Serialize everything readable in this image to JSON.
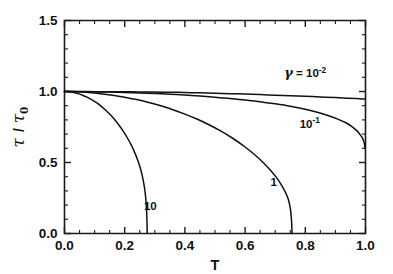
{
  "chart_data": {
    "type": "line",
    "title": "",
    "xlabel": "T",
    "ylabel": "τ / τ₀",
    "xlim": [
      0.0,
      1.0
    ],
    "ylim": [
      0.0,
      1.5
    ],
    "grid": false,
    "legend_position": "inline-annotations",
    "xticks": [
      0.0,
      0.2,
      0.4,
      0.6,
      0.8,
      1.0
    ],
    "xticklabels": [
      "0.0",
      "0.2",
      "0.4",
      "0.6",
      "0.8",
      "1.0"
    ],
    "xminor_step": 0.05,
    "yticks": [
      0.0,
      0.5,
      1.0,
      1.5
    ],
    "yticklabels": [
      "0.0",
      "0.5",
      "1.0",
      "1.5"
    ],
    "yminor_step": 0.1,
    "series": [
      {
        "name": "gamma = 10^-2",
        "label": "γ = 10⁻²",
        "label_gamma": "γ",
        "label_eq": " = 10",
        "label_exp": "-2",
        "label_x": 0.8,
        "label_y": 1.1,
        "x": [
          0.0,
          0.05,
          0.1,
          0.15,
          0.2,
          0.25,
          0.3,
          0.35,
          0.4,
          0.45,
          0.5,
          0.55,
          0.6,
          0.65,
          0.7,
          0.75,
          0.8,
          0.85,
          0.9,
          0.94,
          0.97,
          0.99,
          1.0
        ],
        "y": [
          1.0,
          1.0,
          0.999,
          0.999,
          0.998,
          0.997,
          0.996,
          0.995,
          0.993,
          0.991,
          0.988,
          0.985,
          0.982,
          0.978,
          0.974,
          0.97,
          0.966,
          0.962,
          0.957,
          0.953,
          0.95,
          0.948,
          0.947
        ]
      },
      {
        "name": "gamma = 10^-1",
        "label": "10⁻¹",
        "label_base": "10",
        "label_exp": "-1",
        "label_x": 0.815,
        "label_y": 0.745,
        "x": [
          0.0,
          0.05,
          0.1,
          0.15,
          0.2,
          0.25,
          0.3,
          0.35,
          0.4,
          0.45,
          0.5,
          0.55,
          0.6,
          0.65,
          0.7,
          0.75,
          0.8,
          0.84,
          0.88,
          0.91,
          0.935,
          0.955,
          0.97,
          0.98,
          0.987,
          0.992,
          0.996,
          0.999
        ],
        "y": [
          1.0,
          0.999,
          0.998,
          0.996,
          0.993,
          0.99,
          0.986,
          0.981,
          0.975,
          0.968,
          0.96,
          0.951,
          0.94,
          0.928,
          0.913,
          0.896,
          0.875,
          0.854,
          0.828,
          0.804,
          0.78,
          0.753,
          0.726,
          0.703,
          0.682,
          0.662,
          0.635,
          0.598
        ]
      },
      {
        "name": "gamma = 1",
        "label": "1",
        "label_x": 0.695,
        "label_y": 0.335,
        "x": [
          0.0,
          0.04,
          0.08,
          0.12,
          0.16,
          0.2,
          0.24,
          0.28,
          0.32,
          0.36,
          0.4,
          0.44,
          0.48,
          0.52,
          0.56,
          0.6,
          0.63,
          0.66,
          0.685,
          0.705,
          0.72,
          0.733,
          0.743,
          0.75,
          0.754,
          0.756
        ],
        "y": [
          1.0,
          0.998,
          0.993,
          0.985,
          0.974,
          0.96,
          0.943,
          0.923,
          0.899,
          0.872,
          0.841,
          0.806,
          0.766,
          0.721,
          0.669,
          0.609,
          0.558,
          0.5,
          0.443,
          0.392,
          0.344,
          0.294,
          0.244,
          0.18,
          0.1,
          0.0
        ]
      },
      {
        "name": "gamma = 10",
        "label": "10",
        "label_x": 0.285,
        "label_y": 0.165,
        "x": [
          0.0,
          0.015,
          0.03,
          0.045,
          0.06,
          0.075,
          0.09,
          0.105,
          0.12,
          0.135,
          0.15,
          0.165,
          0.18,
          0.195,
          0.21,
          0.222,
          0.234,
          0.244,
          0.253,
          0.26,
          0.266,
          0.27,
          0.273,
          0.275
        ],
        "y": [
          1.0,
          0.998,
          0.993,
          0.985,
          0.974,
          0.96,
          0.943,
          0.923,
          0.899,
          0.872,
          0.841,
          0.806,
          0.766,
          0.721,
          0.669,
          0.622,
          0.566,
          0.512,
          0.452,
          0.39,
          0.32,
          0.246,
          0.15,
          0.0
        ]
      }
    ]
  },
  "axes": {
    "x_title": "T",
    "y_title_num": "τ",
    "y_title_slash": "/",
    "y_title_den": "τ",
    "y_title_sub": "0"
  }
}
